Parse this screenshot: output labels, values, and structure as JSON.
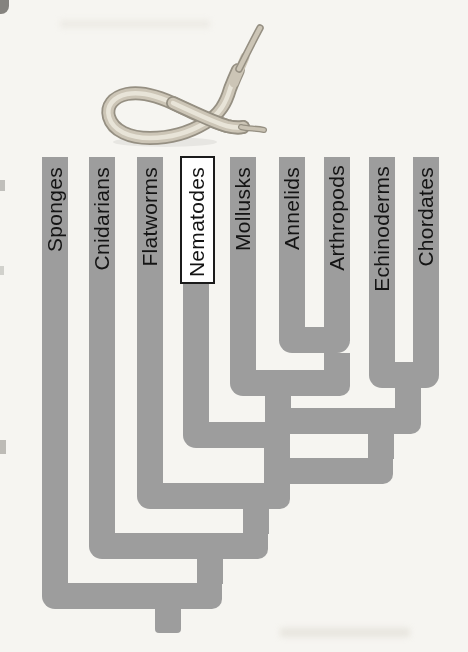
{
  "figure": {
    "type": "phylogenetic-tree-cladogram",
    "highlighted_taxon": "Nematodes",
    "topology_newick": "(Sponges,(Cnidarians,(Flatworms,(Nematodes,((Mollusks,(Annelids,Arthropods)),(Echinoderms,Chordates))))))",
    "illustration": "nematode-roundworm"
  },
  "taxa": [
    {
      "label": "Sponges",
      "highlighted": false
    },
    {
      "label": "Cnidarians",
      "highlighted": false
    },
    {
      "label": "Flatworms",
      "highlighted": false
    },
    {
      "label": "Nematodes",
      "highlighted": true
    },
    {
      "label": "Mollusks",
      "highlighted": false
    },
    {
      "label": "Annelids",
      "highlighted": false
    },
    {
      "label": "Arthropods",
      "highlighted": false
    },
    {
      "label": "Echinoderms",
      "highlighted": false
    },
    {
      "label": "Chordates",
      "highlighted": false
    }
  ],
  "colors": {
    "branch": "#9d9d9d",
    "background": "#f6f5f1",
    "label_text": "#141414",
    "highlight_box_bg": "#ffffff",
    "highlight_box_border": "#1b1b1b",
    "worm_body": "#ccc5b6",
    "worm_outline": "#958f82",
    "worm_highlight": "#e8e4d8"
  }
}
